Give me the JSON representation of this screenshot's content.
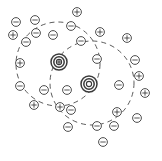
{
  "figure": {
    "background_color": "#ffffff",
    "width": 162,
    "height": 161,
    "ink_color": "#3a3a3a",
    "shell_color": "#4a4a4a"
  },
  "legend": {
    "positive_symbol": "+",
    "negative_symbol": "-",
    "positive_name": "cation",
    "negative_name": "anion",
    "macroion_name": "macroion"
  },
  "chart_data": {
    "type": "scatter",
    "xlabel": "",
    "ylabel": "",
    "xlim": [
      0,
      162
    ],
    "ylim": [
      0,
      161
    ],
    "grid": false,
    "legend_position": "none",
    "macroions": [
      {
        "id": "macroion-1",
        "x": 59,
        "y": 62,
        "r_outer": 8.0,
        "r_inner": 5.2,
        "r_core": 2.6,
        "charge": "+",
        "has_sign": true
      },
      {
        "id": "macroion-2",
        "x": 89,
        "y": 84,
        "r_outer": 8.0,
        "r_inner": 5.2,
        "r_core": 2.6,
        "charge": "",
        "has_sign": false
      }
    ],
    "screening_shells": [
      {
        "id": "shell-1",
        "cx": 58,
        "cy": 64,
        "r": 42,
        "dash": "5,4"
      },
      {
        "id": "shell-2",
        "cx": 92,
        "cy": 83,
        "r": 42,
        "dash": "5,4"
      }
    ],
    "ions": [
      {
        "id": "ion-01",
        "x": 16,
        "y": 22,
        "charge": "-"
      },
      {
        "id": "ion-02",
        "x": 35,
        "y": 20,
        "charge": "-"
      },
      {
        "id": "ion-03",
        "x": 77,
        "y": 12,
        "charge": "+"
      },
      {
        "id": "ion-04",
        "x": 13,
        "y": 35,
        "charge": "+"
      },
      {
        "id": "ion-05",
        "x": 36,
        "y": 33,
        "charge": "-"
      },
      {
        "id": "ion-06",
        "x": 53,
        "y": 35,
        "charge": "-"
      },
      {
        "id": "ion-07",
        "x": 71,
        "y": 26,
        "charge": "-"
      },
      {
        "id": "ion-08",
        "x": 100,
        "y": 32,
        "charge": "+"
      },
      {
        "id": "ion-09",
        "x": 26,
        "y": 42,
        "charge": "-"
      },
      {
        "id": "ion-10",
        "x": 81,
        "y": 41,
        "charge": "-"
      },
      {
        "id": "ion-11",
        "x": 127,
        "y": 38,
        "charge": "+"
      },
      {
        "id": "ion-12",
        "x": 20,
        "y": 63,
        "charge": "+"
      },
      {
        "id": "ion-13",
        "x": 97,
        "y": 59,
        "charge": "-"
      },
      {
        "id": "ion-14",
        "x": 135,
        "y": 60,
        "charge": "-"
      },
      {
        "id": "ion-15",
        "x": 20,
        "y": 86,
        "charge": "-"
      },
      {
        "id": "ion-16",
        "x": 119,
        "y": 85,
        "charge": "-"
      },
      {
        "id": "ion-17",
        "x": 139,
        "y": 76,
        "charge": "+"
      },
      {
        "id": "ion-18",
        "x": 44,
        "y": 90,
        "charge": "-"
      },
      {
        "id": "ion-19",
        "x": 67,
        "y": 90,
        "charge": "-"
      },
      {
        "id": "ion-20",
        "x": 145,
        "y": 93,
        "charge": "+"
      },
      {
        "id": "ion-21",
        "x": 34,
        "y": 105,
        "charge": "+"
      },
      {
        "id": "ion-22",
        "x": 60,
        "y": 107,
        "charge": "+"
      },
      {
        "id": "ion-23",
        "x": 71,
        "y": 110,
        "charge": "-"
      },
      {
        "id": "ion-24",
        "x": 117,
        "y": 112,
        "charge": "+"
      },
      {
        "id": "ion-25",
        "x": 68,
        "y": 127,
        "charge": "-"
      },
      {
        "id": "ion-26",
        "x": 97,
        "y": 126,
        "charge": "-"
      },
      {
        "id": "ion-27",
        "x": 114,
        "y": 126,
        "charge": "-"
      },
      {
        "id": "ion-28",
        "x": 137,
        "y": 118,
        "charge": "-"
      },
      {
        "id": "ion-29",
        "x": 103,
        "y": 142,
        "charge": "-"
      }
    ]
  }
}
